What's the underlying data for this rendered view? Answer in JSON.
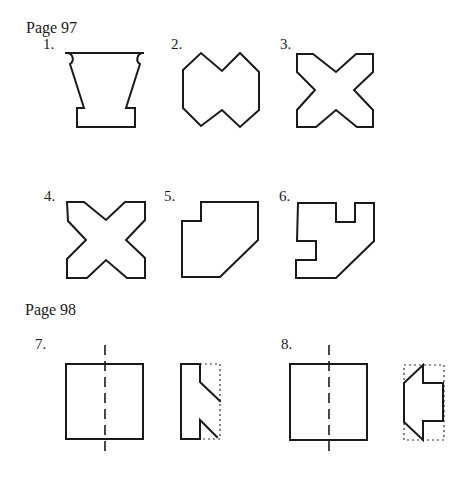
{
  "sections": [
    {
      "heading": "Page 97",
      "figures": [
        {
          "label": "1.",
          "shape": "vase-with-notches"
        },
        {
          "label": "2.",
          "shape": "double-hexagon"
        },
        {
          "label": "3.",
          "shape": "cross-x"
        },
        {
          "label": "4.",
          "shape": "cross-x"
        },
        {
          "label": "5.",
          "shape": "pentagon-with-notch"
        },
        {
          "label": "6.",
          "shape": "polygon-with-two-notches"
        }
      ]
    },
    {
      "heading": "Page 98",
      "figures": [
        {
          "label": "7.",
          "shape": "square-with-fold-line-and-cut-piece"
        },
        {
          "label": "8.",
          "shape": "square-with-fold-line-and-cut-piece"
        }
      ]
    }
  ]
}
